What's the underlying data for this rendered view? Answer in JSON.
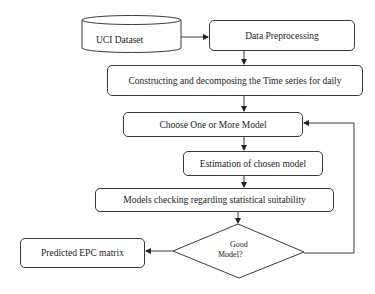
{
  "diagram": {
    "type": "flowchart",
    "nodes": {
      "uci_dataset": {
        "label": "UCI Dataset",
        "shape": "cylinder"
      },
      "data_preprocessing": {
        "label": "Data Preprocessing",
        "shape": "rounded-rect"
      },
      "constructing": {
        "label": "Constructing and decomposing the Time series for daily",
        "shape": "rounded-rect"
      },
      "choose_model": {
        "label": "Choose One or More Model",
        "shape": "rounded-rect"
      },
      "estimation": {
        "label": "Estimation of chosen model",
        "shape": "rounded-rect"
      },
      "models_checking": {
        "label": "Models checking regarding statistical suitability",
        "shape": "rounded-rect"
      },
      "good_model": {
        "label_line1": "Good",
        "label_line2": "Model?",
        "shape": "diamond"
      },
      "predicted": {
        "label": "Predicted EPC matrix",
        "shape": "rounded-rect"
      }
    },
    "edges": [
      {
        "from": "uci_dataset",
        "to": "data_preprocessing"
      },
      {
        "from": "data_preprocessing",
        "to": "constructing"
      },
      {
        "from": "constructing",
        "to": "choose_model"
      },
      {
        "from": "choose_model",
        "to": "estimation"
      },
      {
        "from": "estimation",
        "to": "models_checking"
      },
      {
        "from": "models_checking",
        "to": "good_model"
      },
      {
        "from": "good_model",
        "to": "predicted",
        "condition": "yes"
      },
      {
        "from": "good_model",
        "to": "choose_model",
        "condition": "no (feedback loop)"
      }
    ],
    "colors": {
      "stroke": "#3a3a3a",
      "fill": "#ffffff",
      "text": "#222222"
    }
  }
}
